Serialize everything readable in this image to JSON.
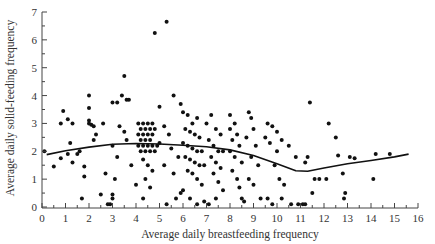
{
  "chart_data": {
    "type": "scatter",
    "title": "",
    "xlabel": "Average daily breastfeeding frequency",
    "ylabel": "Average daily solid-feeding frequency",
    "xlim": [
      0,
      16
    ],
    "ylim": [
      0,
      7
    ],
    "x_ticks": [
      0,
      1,
      2,
      3,
      4,
      5,
      6,
      7,
      8,
      9,
      10,
      11,
      12,
      13,
      14,
      15,
      16
    ],
    "y_ticks": [
      0,
      1,
      2,
      3,
      4,
      5,
      6,
      7
    ],
    "grid": false,
    "legend": null,
    "colors": {
      "points": "#111111",
      "axis": "#444444",
      "smooth": "#111111"
    },
    "smooth_line": {
      "name": "lowess fit",
      "x": [
        0.2,
        1,
        2,
        3,
        4,
        5,
        6,
        7,
        8,
        9,
        10,
        10.8,
        11.3,
        12,
        13,
        14,
        15,
        15.6
      ],
      "y": [
        1.88,
        2.02,
        2.15,
        2.25,
        2.28,
        2.26,
        2.22,
        2.16,
        2.05,
        1.85,
        1.55,
        1.3,
        1.28,
        1.4,
        1.55,
        1.67,
        1.8,
        1.9
      ]
    },
    "points": [
      [
        0.1,
        2.0
      ],
      [
        0.5,
        1.45
      ],
      [
        0.8,
        1.75
      ],
      [
        0.8,
        3.0
      ],
      [
        0.9,
        3.45
      ],
      [
        1.1,
        1.9
      ],
      [
        1.1,
        3.15
      ],
      [
        1.2,
        2.3
      ],
      [
        1.3,
        1.6
      ],
      [
        1.3,
        3.0
      ],
      [
        1.5,
        1.9
      ],
      [
        1.6,
        2.0
      ],
      [
        1.8,
        1.45
      ],
      [
        1.8,
        1.1
      ],
      [
        1.7,
        0.3
      ],
      [
        2.0,
        4.0
      ],
      [
        2.0,
        3.55
      ],
      [
        2.0,
        3.1
      ],
      [
        2.0,
        3.0
      ],
      [
        2.1,
        2.95
      ],
      [
        2.2,
        2.9
      ],
      [
        2.3,
        2.6
      ],
      [
        2.2,
        2.4
      ],
      [
        2.6,
        3.0
      ],
      [
        2.7,
        1.2
      ],
      [
        2.5,
        0.45
      ],
      [
        2.9,
        0.1
      ],
      [
        3.0,
        0.3
      ],
      [
        3.1,
        1.0
      ],
      [
        3.0,
        3.75
      ],
      [
        3.2,
        3.75
      ],
      [
        3.4,
        4.0
      ],
      [
        3.5,
        4.7
      ],
      [
        3.6,
        3.85
      ],
      [
        3.7,
        3.85
      ],
      [
        3.3,
        2.9
      ],
      [
        3.5,
        2.7
      ],
      [
        3.6,
        2.4
      ],
      [
        3.0,
        2.2
      ],
      [
        3.2,
        1.8
      ],
      [
        3.8,
        1.5
      ],
      [
        4.0,
        0.8
      ],
      [
        4.3,
        0.3
      ],
      [
        4.8,
        6.25
      ],
      [
        5.3,
        6.65
      ],
      [
        5.0,
        3.6
      ],
      [
        5.6,
        4.0
      ],
      [
        5.9,
        3.7
      ],
      [
        5.2,
        2.9
      ],
      [
        5.4,
        2.6
      ],
      [
        5.0,
        2.3
      ],
      [
        5.5,
        2.1
      ],
      [
        5.8,
        1.8
      ],
      [
        5.2,
        1.5
      ],
      [
        5.6,
        1.2
      ],
      [
        5.9,
        0.5
      ],
      [
        5.3,
        0.1
      ],
      [
        4.1,
        3.0
      ],
      [
        4.3,
        3.0
      ],
      [
        4.5,
        3.0
      ],
      [
        4.7,
        3.0
      ],
      [
        4.2,
        2.8
      ],
      [
        4.4,
        2.8
      ],
      [
        4.6,
        2.8
      ],
      [
        4.8,
        2.8
      ],
      [
        4.1,
        2.6
      ],
      [
        4.3,
        2.6
      ],
      [
        4.5,
        2.6
      ],
      [
        4.7,
        2.6
      ],
      [
        4.2,
        2.4
      ],
      [
        4.4,
        2.4
      ],
      [
        4.6,
        2.4
      ],
      [
        4.1,
        2.2
      ],
      [
        4.3,
        2.2
      ],
      [
        4.5,
        2.2
      ],
      [
        4.7,
        2.2
      ],
      [
        4.9,
        2.2
      ],
      [
        4.2,
        2.0
      ],
      [
        4.4,
        2.0
      ],
      [
        4.6,
        2.0
      ],
      [
        4.8,
        2.0
      ],
      [
        4.3,
        1.7
      ],
      [
        4.5,
        1.5
      ],
      [
        4.7,
        1.3
      ],
      [
        4.4,
        1.0
      ],
      [
        4.6,
        0.7
      ],
      [
        6.0,
        3.4
      ],
      [
        6.2,
        3.3
      ],
      [
        6.4,
        3.0
      ],
      [
        6.6,
        3.2
      ],
      [
        6.1,
        2.8
      ],
      [
        6.3,
        2.7
      ],
      [
        6.5,
        2.6
      ],
      [
        6.7,
        2.5
      ],
      [
        6.0,
        2.3
      ],
      [
        6.2,
        2.2
      ],
      [
        6.4,
        2.1
      ],
      [
        6.6,
        2.0
      ],
      [
        6.8,
        2.0
      ],
      [
        6.1,
        1.8
      ],
      [
        6.3,
        1.7
      ],
      [
        6.5,
        1.6
      ],
      [
        6.7,
        1.5
      ],
      [
        6.9,
        1.5
      ],
      [
        6.2,
        1.3
      ],
      [
        6.4,
        1.2
      ],
      [
        6.6,
        1.0
      ],
      [
        6.8,
        0.8
      ],
      [
        6.0,
        0.6
      ],
      [
        6.3,
        0.3
      ],
      [
        6.6,
        0.1
      ],
      [
        6.9,
        0.2
      ],
      [
        7.1,
        0.1
      ],
      [
        7.0,
        3.0
      ],
      [
        7.2,
        3.3
      ],
      [
        7.4,
        2.8
      ],
      [
        7.6,
        2.6
      ],
      [
        7.1,
        2.4
      ],
      [
        7.3,
        2.2
      ],
      [
        7.5,
        2.0
      ],
      [
        7.7,
        2.0
      ],
      [
        7.2,
        1.8
      ],
      [
        7.4,
        1.6
      ],
      [
        7.6,
        1.4
      ],
      [
        7.3,
        1.2
      ],
      [
        7.5,
        0.9
      ],
      [
        7.7,
        0.6
      ],
      [
        7.4,
        0.3
      ],
      [
        8.0,
        3.3
      ],
      [
        8.2,
        3.0
      ],
      [
        8.0,
        2.8
      ],
      [
        8.3,
        2.6
      ],
      [
        8.1,
        2.4
      ],
      [
        8.4,
        2.2
      ],
      [
        8.0,
        2.0
      ],
      [
        8.2,
        1.8
      ],
      [
        8.5,
        1.6
      ],
      [
        8.1,
        1.3
      ],
      [
        8.3,
        1.0
      ],
      [
        8.4,
        0.7
      ],
      [
        8.5,
        0.3
      ],
      [
        8.6,
        0.2
      ],
      [
        8.8,
        3.4
      ],
      [
        8.9,
        3.2
      ],
      [
        9.0,
        2.8
      ],
      [
        8.7,
        2.5
      ],
      [
        9.1,
        2.2
      ],
      [
        8.9,
        1.8
      ],
      [
        9.2,
        1.5
      ],
      [
        8.8,
        1.0
      ],
      [
        9.0,
        0.8
      ],
      [
        9.3,
        0.3
      ],
      [
        9.6,
        0.3
      ],
      [
        9.8,
        0.1
      ],
      [
        9.6,
        3.0
      ],
      [
        9.8,
        2.9
      ],
      [
        10.0,
        2.7
      ],
      [
        9.5,
        2.5
      ],
      [
        9.7,
        2.3
      ],
      [
        10.0,
        2.0
      ],
      [
        10.2,
        2.4
      ],
      [
        9.9,
        1.5
      ],
      [
        10.1,
        1.0
      ],
      [
        10.3,
        0.8
      ],
      [
        10.2,
        0.3
      ],
      [
        10.6,
        0.1
      ],
      [
        10.9,
        0.1
      ],
      [
        11.2,
        0.1
      ],
      [
        10.5,
        2.2
      ],
      [
        10.8,
        1.8
      ],
      [
        11.2,
        1.6
      ],
      [
        11.4,
        3.75
      ],
      [
        11.6,
        1.0
      ],
      [
        11.5,
        0.5
      ],
      [
        12.2,
        3.0
      ],
      [
        12.5,
        2.5
      ],
      [
        12.8,
        1.2
      ],
      [
        12.9,
        0.5
      ],
      [
        12.85,
        0.3
      ],
      [
        13.1,
        1.8
      ],
      [
        13.3,
        1.75
      ],
      [
        12.6,
        1.85
      ],
      [
        12.1,
        1.0
      ],
      [
        11.8,
        1.0
      ],
      [
        14.2,
        1.9
      ],
      [
        14.8,
        1.9
      ],
      [
        14.1,
        1.0
      ],
      [
        11.3,
        1.8
      ],
      [
        11.1,
        0.1
      ],
      [
        3.0,
        0.45
      ],
      [
        2.8,
        0.1
      ],
      [
        5.7,
        0.3
      ]
    ]
  }
}
